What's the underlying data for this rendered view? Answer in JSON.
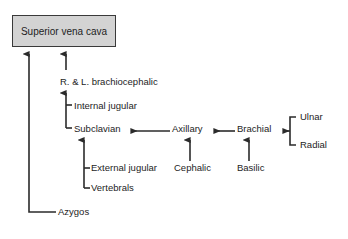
{
  "diagram": {
    "title_node": {
      "label": "Superior vena cava",
      "fill_color": "#d3d3d3",
      "border_color": "#3a3a3a"
    },
    "nodes": [
      {
        "id": "brachiocephalic",
        "label": "R. & L. brachiocephalic"
      },
      {
        "id": "internal-jugular",
        "label": "Internal jugular"
      },
      {
        "id": "subclavian",
        "label": "Subclavian"
      },
      {
        "id": "axillary",
        "label": "Axillary"
      },
      {
        "id": "brachial",
        "label": "Brachial"
      },
      {
        "id": "ulnar",
        "label": "Ulnar"
      },
      {
        "id": "radial",
        "label": "Radial"
      },
      {
        "id": "external-jugular",
        "label": "External jugular"
      },
      {
        "id": "cephalic",
        "label": "Cephalic"
      },
      {
        "id": "basilic",
        "label": "Basilic"
      },
      {
        "id": "vertebrals",
        "label": "Vertebrals"
      },
      {
        "id": "azygos",
        "label": "Azygos"
      }
    ],
    "edges": [
      {
        "from": "azygos",
        "to": "superior-vena-cava"
      },
      {
        "from": "brachiocephalic",
        "to": "superior-vena-cava"
      },
      {
        "from": "subclavian",
        "to": "brachiocephalic"
      },
      {
        "from": "internal-jugular",
        "to": "brachiocephalic"
      },
      {
        "from": "axillary",
        "to": "subclavian"
      },
      {
        "from": "external-jugular",
        "to": "subclavian"
      },
      {
        "from": "vertebrals",
        "to": "subclavian"
      },
      {
        "from": "brachial",
        "to": "axillary"
      },
      {
        "from": "cephalic",
        "to": "axillary"
      },
      {
        "from": "ulnar",
        "to": "brachial"
      },
      {
        "from": "radial",
        "to": "brachial"
      },
      {
        "from": "basilic",
        "to": "brachial"
      }
    ],
    "line_color": "#2b2b2b",
    "background_color": "#ffffff"
  }
}
